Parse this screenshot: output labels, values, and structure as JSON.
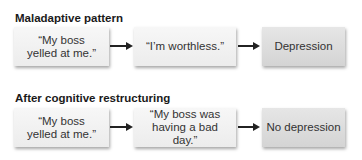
{
  "rows": [
    {
      "title": "Maladaptive pattern",
      "steps": [
        "“My boss yelled at me.”",
        "“I’m worthless.”",
        "Depression"
      ]
    },
    {
      "title": "After cognitive restructuring",
      "steps": [
        "“My boss yelled at me.”",
        "“My boss was having a bad day.”",
        "No depression"
      ]
    }
  ]
}
